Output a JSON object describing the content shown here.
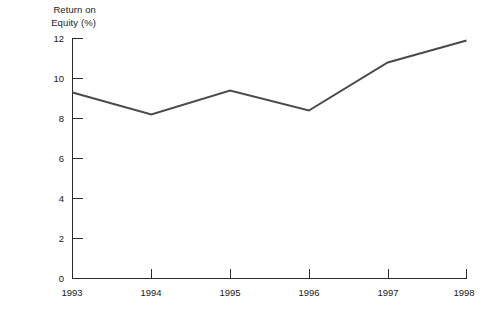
{
  "chart_data": {
    "type": "line",
    "title": "Return on\nEquity (%)",
    "title_lines": [
      "Return on",
      "Equity (%)"
    ],
    "xlabel": "",
    "ylabel": "Return on Equity (%)",
    "categories": [
      "1993",
      "1994",
      "1995",
      "1996",
      "1997",
      "1998"
    ],
    "x": [
      1993,
      1994,
      1995,
      1996,
      1997,
      1998
    ],
    "values": [
      9.3,
      8.2,
      9.4,
      8.4,
      10.8,
      11.9
    ],
    "series": [
      {
        "name": "Return on Equity (%)",
        "values": [
          9.3,
          8.2,
          9.4,
          8.4,
          10.8,
          11.9
        ],
        "color": "#4a4a4a"
      }
    ],
    "ylim": [
      0,
      12
    ],
    "yticks": [
      0,
      2,
      4,
      6,
      8,
      10,
      12
    ],
    "ytick_labels": [
      "0",
      "2",
      "4",
      "6",
      "8",
      "10",
      "12"
    ],
    "xtick_labels": [
      "1993",
      "1994",
      "1995",
      "1996",
      "1997",
      "1998"
    ],
    "grid": false,
    "legend": false,
    "legend_position": "none",
    "tick_direction": "in",
    "line_color": "#4a4a4a",
    "axis_color": "#2b2b2b",
    "background_color": "#ffffff"
  }
}
